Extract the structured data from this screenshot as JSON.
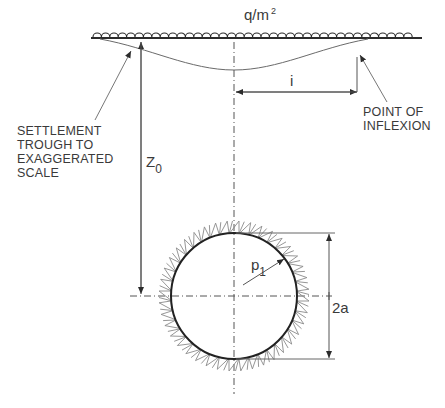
{
  "diagram": {
    "load_label": "q/m",
    "load_label_sup": "2",
    "settlement_note": [
      "SETTLEMENT",
      "TROUGH TO",
      "EXAGGERATED",
      "SCALE"
    ],
    "inflexion_note": [
      "POINT OF",
      "INFLEXION"
    ],
    "depth_symbol": "Z",
    "depth_subscript": "0",
    "inflexion_distance_symbol": "i",
    "pressure_symbol": "p",
    "pressure_subscript": "1",
    "diameter_label": "2a",
    "colors": {
      "line": "#2b2b2b",
      "thin_line": "#555555",
      "hatch": "#8a8a8a",
      "text": "#3a3a3a"
    },
    "geometry": {
      "ground_y": 38,
      "ground_x": [
        91,
        422
      ],
      "centerline_x": 234,
      "tunnel_center": [
        234,
        296
      ],
      "tunnel_radius": 63,
      "trough_max_depth_y": 70,
      "inflexion_x": 357
    }
  }
}
